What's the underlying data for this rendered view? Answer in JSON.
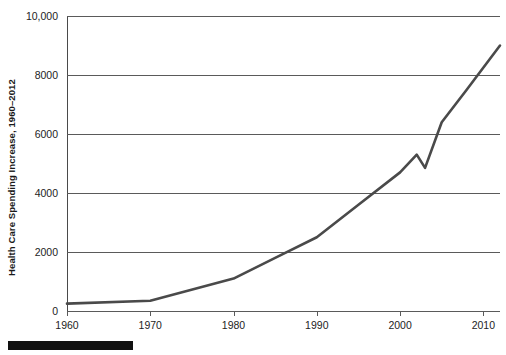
{
  "chart_data": {
    "type": "line",
    "title": "",
    "subtitle": "",
    "xlabel": "",
    "ylabel": "Health Care Spending Increase, 1960–2012",
    "xlim": [
      1960,
      2012
    ],
    "ylim": [
      0,
      10000
    ],
    "grid": true,
    "legend": null,
    "legend_position": "none",
    "y_ticks": [
      {
        "value": 10000,
        "label": "10,000"
      },
      {
        "value": 8000,
        "label": "8000"
      },
      {
        "value": 6000,
        "label": "6000"
      },
      {
        "value": 4000,
        "label": "4000"
      },
      {
        "value": 2000,
        "label": "2000"
      },
      {
        "value": 0,
        "label": "0"
      }
    ],
    "x_ticks": [
      {
        "value": 1960,
        "label": "1960"
      },
      {
        "value": 1970,
        "label": "1970"
      },
      {
        "value": 1980,
        "label": "1980"
      },
      {
        "value": 1990,
        "label": "1990"
      },
      {
        "value": 2000,
        "label": "2000"
      },
      {
        "value": 2010,
        "label": "2010"
      }
    ],
    "x": [
      1960,
      1970,
      1980,
      1985,
      1990,
      1995,
      2000,
      2002,
      2003,
      2005,
      2008,
      2012
    ],
    "values": [
      250,
      350,
      1100,
      1800,
      2500,
      3600,
      4700,
      5300,
      4850,
      6400,
      7500,
      9000
    ],
    "series": [
      {
        "name": "Health Care Spending",
        "color": "#4a4a4a",
        "values": [
          250,
          350,
          1100,
          1800,
          2500,
          3600,
          4700,
          5300,
          4850,
          6400,
          7500,
          9000
        ]
      }
    ],
    "annotations": []
  },
  "decoration": {
    "bottom_bar_color": "#111111"
  },
  "axis_colors": {
    "gridline": "#5a5a5a",
    "axis": "#4a4a4a",
    "text": "#1d1d1d"
  }
}
